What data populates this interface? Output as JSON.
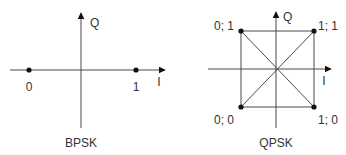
{
  "colors": {
    "line": "#4a4a4a",
    "point": "#111111",
    "text": "#333333",
    "background": "#ffffff"
  },
  "bpsk": {
    "caption": "BPSK",
    "axis_x_label": "I",
    "axis_y_label": "Q",
    "points": [
      {
        "label": "0",
        "i": -1,
        "q": 0
      },
      {
        "label": "1",
        "i": 1,
        "q": 0
      }
    ]
  },
  "qpsk": {
    "caption": "QPSK",
    "axis_x_label": "I",
    "axis_y_label": "Q",
    "points": [
      {
        "label": "0; 1",
        "i": -1,
        "q": 1
      },
      {
        "label": "1; 1",
        "i": 1,
        "q": 1
      },
      {
        "label": "0; 0",
        "i": -1,
        "q": -1
      },
      {
        "label": "1; 0",
        "i": 1,
        "q": -1
      }
    ]
  }
}
